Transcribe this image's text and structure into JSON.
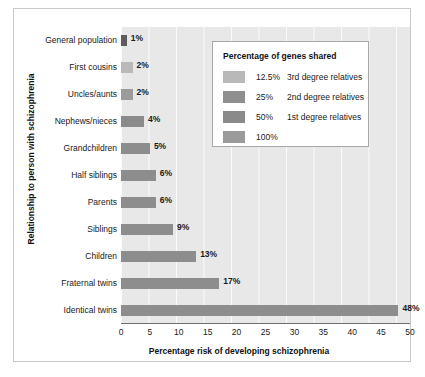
{
  "figure": {
    "top_caption": "",
    "x_axis_title": "Percentage risk of developing schizophrenia",
    "y_axis_title": "Relationship to person with schizophrenia"
  },
  "legend": {
    "title": "Percentage of genes shared",
    "items": [
      {
        "pct": "12.5%",
        "desc": "3rd degree relatives",
        "color": "#b9b9b9"
      },
      {
        "pct": "25%",
        "desc": "2nd degree relatives",
        "color": "#8f8f8f"
      },
      {
        "pct": "50%",
        "desc": "1st degree relatives",
        "color": "#8a8a8a"
      },
      {
        "pct": "100%",
        "desc": "",
        "color": "#9a9a9a"
      }
    ]
  },
  "x_ticks": [
    "0",
    "5",
    "10",
    "15",
    "20",
    "25",
    "30",
    "35",
    "40",
    "45",
    "50"
  ],
  "chart_data": {
    "type": "bar",
    "orientation": "horizontal",
    "title": "",
    "xlabel": "Percentage risk of developing schizophrenia",
    "ylabel": "Relationship to person with schizophrenia",
    "xlim": [
      0,
      50
    ],
    "xticks": [
      0,
      5,
      10,
      15,
      20,
      25,
      30,
      35,
      40,
      45,
      50
    ],
    "grid": "vertical",
    "legend_position": "upper-right-inside",
    "categories": [
      "General population",
      "First cousins",
      "Uncles/aunts",
      "Nephews/nieces",
      "Grandchildren",
      "Half siblings",
      "Parents",
      "Siblings",
      "Children",
      "Fraternal twins",
      "Identical twins"
    ],
    "values": [
      1,
      2,
      2,
      4,
      5,
      6,
      6,
      9,
      13,
      17,
      48
    ],
    "value_labels": [
      "1%",
      "2%",
      "2%",
      "4%",
      "5%",
      "6%",
      "6%",
      "9%",
      "13%",
      "17%",
      "48%"
    ],
    "bar_colors": [
      "#5d5d5d",
      "#b9b9b9",
      "#9b9b9b",
      "#8b8b8b",
      "#8d8d8d",
      "#8d8d8d",
      "#8d8d8d",
      "#8d8d8d",
      "#8d8d8d",
      "#8d8d8d",
      "#8d8d8d"
    ],
    "genes_shared_group": [
      "12.5%",
      "12.5%",
      "25%",
      "25%",
      "25%",
      "25%",
      "50%",
      "50%",
      "50%",
      "50%",
      "100%"
    ]
  }
}
